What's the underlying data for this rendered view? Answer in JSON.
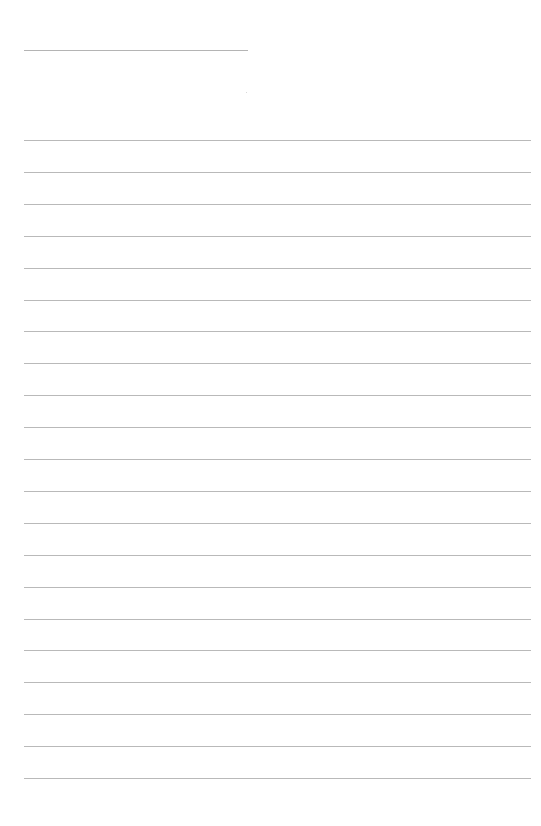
{
  "document": {
    "type": "ruled-notepad-page",
    "title_line": {
      "x": 24,
      "y": 50,
      "width": 224
    },
    "ruled_lines": {
      "count": 21,
      "first_y": 140,
      "spacing": 31.9,
      "x": 24,
      "width": 507
    },
    "text_content": []
  },
  "colors": {
    "background": "#ffffff",
    "line": "#b9b9b9",
    "title_line": "#b4b4b4"
  }
}
